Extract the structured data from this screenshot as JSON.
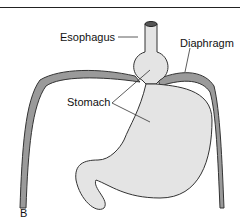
{
  "figure": {
    "panel_label": "B",
    "labels": {
      "esophagus": "Esophagus",
      "diaphragm": "Diaphragm",
      "stomach": "Stomach"
    },
    "colors": {
      "organ_fill": "#e4e4e4",
      "diaphragm_fill": "#9a9a9a",
      "outline": "#333333"
    }
  }
}
